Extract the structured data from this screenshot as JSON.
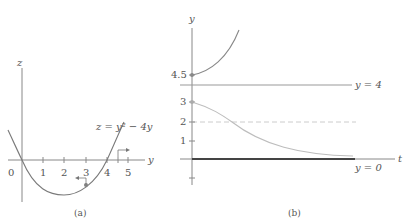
{
  "panel_a": {
    "caption": "(a)",
    "vertical_axis_label": "z",
    "horizontal_axis_label": "y",
    "origin_label": "0",
    "tick_labels": [
      "1",
      "2",
      "3",
      "4",
      "5"
    ],
    "curve_label": "z = y² − 4y",
    "curve_color": "#7a7a7a",
    "axis_color": "#888888",
    "marked_point_color": "#808080"
  },
  "panel_b": {
    "caption": "(b)",
    "vertical_axis_label": "y",
    "horizontal_axis_label": "t",
    "tick_labels": [
      "4.5",
      "3",
      "2",
      "1"
    ],
    "line_labels": {
      "upper": "y = 4",
      "lower": "y = 0"
    },
    "curve_color": "#888888",
    "decay_curve_color": "#bdbdbd",
    "dashed_color": "#cccccc",
    "thick_line_color": "#444444"
  }
}
